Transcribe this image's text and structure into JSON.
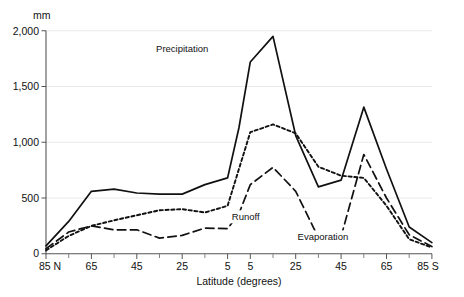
{
  "chart_data": {
    "type": "line",
    "title": "",
    "xlabel": "Latitude (degrees)",
    "ylabel": "mm",
    "ylim": [
      0,
      2000
    ],
    "yticks": [
      0,
      500,
      1000,
      1500,
      2000
    ],
    "ytick_labels": [
      "0",
      "500",
      "1,000",
      "1,500",
      "2,000"
    ],
    "xtick_labels": [
      "85 N",
      "65",
      "45",
      "25",
      "5",
      "5",
      "25",
      "45",
      "65",
      "85 S"
    ],
    "x_positions": [
      0,
      2,
      4,
      6,
      8,
      9,
      11,
      13,
      15,
      17
    ],
    "grid": "horizontal",
    "legend_position": "inline-annotations",
    "x": [
      0,
      1,
      2,
      3,
      4,
      5,
      6,
      7,
      8,
      8.5,
      9,
      10,
      11,
      12,
      13,
      14,
      15,
      16,
      17
    ],
    "series": [
      {
        "name": "Precipitation",
        "style": "solid",
        "label_x": 6.0,
        "label_y": 1810,
        "values": [
          70,
          290,
          560,
          580,
          545,
          535,
          535,
          620,
          680,
          1130,
          1720,
          1950,
          1060,
          600,
          660,
          1315,
          760,
          240,
          100
        ]
      },
      {
        "name": "Evaporation",
        "style": "dotted",
        "label_x": 12.2,
        "label_y": 120,
        "values": [
          30,
          160,
          250,
          300,
          345,
          390,
          400,
          370,
          430,
          760,
          1090,
          1160,
          1080,
          780,
          700,
          680,
          430,
          130,
          55
        ]
      },
      {
        "name": "Runoff",
        "style": "dashed",
        "label_x": 8.8,
        "label_y": 300,
        "values": [
          45,
          195,
          250,
          215,
          215,
          140,
          165,
          230,
          225,
          360,
          620,
          775,
          560,
          145,
          155,
          890,
          500,
          170,
          65
        ]
      }
    ],
    "colors": {
      "line": "#111111",
      "grid": "#e9e9e9",
      "axis": "#555555",
      "background": "#ffffff"
    }
  },
  "axis": {
    "unit_label": "mm",
    "x_axis_title": "Latitude (degrees)"
  },
  "annotations": {
    "precipitation": "Precipitation",
    "runoff": "Runoff",
    "evaporation": "Evaporation"
  }
}
